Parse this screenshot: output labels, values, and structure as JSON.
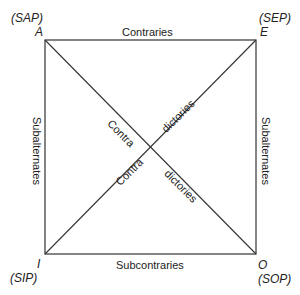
{
  "diagram": {
    "corners": {
      "A": {
        "letter": "A",
        "form": "(SAP)"
      },
      "E": {
        "letter": "E",
        "form": "(SEP)"
      },
      "I": {
        "letter": "I",
        "form": "(SIP)"
      },
      "O": {
        "letter": "O",
        "form": "(SOP)"
      }
    },
    "edges": {
      "top": "Contraries",
      "bottom": "Subcontraries",
      "left": "Subalternates",
      "right": "Subalternates"
    },
    "diagonals": {
      "ao_upper": "Contra",
      "ao_lower": "dictories",
      "ei_upper": "dictories",
      "ei_lower": "Contra"
    },
    "colors": {
      "line": "#333333",
      "text": "#222222"
    }
  }
}
